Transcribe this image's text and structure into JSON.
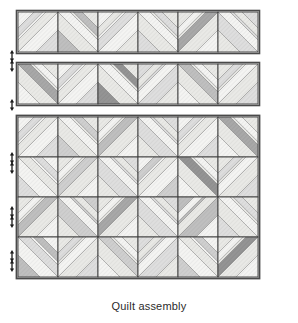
{
  "caption": "Quilt assembly",
  "figure": {
    "title": "Quilt assembly",
    "type": "quilt-assembly-diagram",
    "background": "#ffffff"
  },
  "colors": {
    "outline": "#4a4a4a",
    "block_outline": "#3d3d3d",
    "seam_line": "#6b6b6b",
    "arrow": "#1a1a1a",
    "caption_text": "#2b2b2b",
    "fabric_white": "#f4f4f2",
    "fabric_light": "#e9e9e6",
    "fabric_light2": "#dedede",
    "fabric_mid": "#cfcfcf",
    "fabric_mid2": "#bfbfbf",
    "fabric_dark": "#a8a8a8",
    "fabric_darker": "#949494"
  },
  "layout": {
    "strip_count": 2,
    "strip_block_count": 6,
    "quilt_columns": 6,
    "quilt_rows": 4,
    "block_size_px": 40,
    "quilt_left": 18,
    "quilt_top": 117,
    "strips": [
      {
        "label": "strip-row-1",
        "left": 18,
        "top": 12
      },
      {
        "label": "strip-row-2",
        "left": 18,
        "top": 64
      }
    ],
    "arrows": [
      {
        "name": "seam-arrow-1",
        "x": 12,
        "y": 56
      },
      {
        "name": "seam-arrow-2",
        "x": 12,
        "y": 66
      },
      {
        "name": "seam-arrow-3",
        "x": 12,
        "y": 105
      },
      {
        "name": "seam-arrow-4",
        "x": 12,
        "y": 158
      },
      {
        "name": "seam-arrow-5",
        "x": 12,
        "y": 168
      },
      {
        "name": "seam-arrow-6",
        "x": 12,
        "y": 212
      },
      {
        "name": "seam-arrow-7",
        "x": 12,
        "y": 222
      },
      {
        "name": "seam-arrow-8",
        "x": 12,
        "y": 256
      },
      {
        "name": "seam-arrow-9",
        "x": 12,
        "y": 266
      }
    ]
  },
  "chart_data": {
    "type": "table",
    "title": "Quilt assembly",
    "xlabel": "",
    "ylabel": "",
    "strip_rows": [
      {
        "name": "strip-row-1",
        "blocks": [
          {
            "variant": "ne",
            "tones": [
              "light",
              "white",
              "light2"
            ]
          },
          {
            "variant": "nw",
            "tones": [
              "white",
              "light",
              "mid2"
            ]
          },
          {
            "variant": "ne",
            "tones": [
              "light2",
              "white",
              "light"
            ]
          },
          {
            "variant": "nw",
            "tones": [
              "white",
              "light",
              "light2"
            ]
          },
          {
            "variant": "ne",
            "tones": [
              "dark",
              "light",
              "white"
            ]
          },
          {
            "variant": "nw",
            "tones": [
              "white",
              "light2",
              "light"
            ]
          }
        ]
      },
      {
        "name": "strip-row-2",
        "blocks": [
          {
            "variant": "nw",
            "tones": [
              "dark",
              "light",
              "white"
            ]
          },
          {
            "variant": "ne",
            "tones": [
              "light",
              "white",
              "light2"
            ]
          },
          {
            "variant": "nw",
            "tones": [
              "white",
              "light",
              "darker"
            ]
          },
          {
            "variant": "ne",
            "tones": [
              "white",
              "light2",
              "light"
            ]
          },
          {
            "variant": "nw",
            "tones": [
              "mid2",
              "light",
              "white"
            ]
          },
          {
            "variant": "ne",
            "tones": [
              "white",
              "light",
              "light2"
            ]
          }
        ]
      }
    ],
    "quilt_rows": [
      {
        "name": "quilt-row-1",
        "blocks": [
          {
            "variant": "ne",
            "tones": [
              "light",
              "white",
              "light2"
            ]
          },
          {
            "variant": "nw",
            "tones": [
              "white",
              "light",
              "mid"
            ]
          },
          {
            "variant": "ne",
            "tones": [
              "mid2",
              "light",
              "white"
            ]
          },
          {
            "variant": "nw",
            "tones": [
              "white",
              "light2",
              "light"
            ]
          },
          {
            "variant": "ne",
            "tones": [
              "light",
              "white",
              "light2"
            ]
          },
          {
            "variant": "nw",
            "tones": [
              "dark",
              "light",
              "white"
            ]
          }
        ]
      },
      {
        "name": "quilt-row-2",
        "blocks": [
          {
            "variant": "nw",
            "tones": [
              "light",
              "white",
              "light2"
            ]
          },
          {
            "variant": "ne",
            "tones": [
              "mid",
              "light",
              "white"
            ]
          },
          {
            "variant": "nw",
            "tones": [
              "white",
              "light2",
              "light"
            ]
          },
          {
            "variant": "ne",
            "tones": [
              "light",
              "white",
              "mid"
            ]
          },
          {
            "variant": "nw",
            "tones": [
              "darker",
              "light",
              "white"
            ]
          },
          {
            "variant": "ne",
            "tones": [
              "white",
              "light",
              "light2"
            ]
          }
        ]
      },
      {
        "name": "quilt-row-3",
        "blocks": [
          {
            "variant": "ne",
            "tones": [
              "mid2",
              "light",
              "white"
            ]
          },
          {
            "variant": "nw",
            "tones": [
              "white",
              "mid",
              "light"
            ]
          },
          {
            "variant": "ne",
            "tones": [
              "dark",
              "light",
              "white"
            ]
          },
          {
            "variant": "nw",
            "tones": [
              "white",
              "light2",
              "light"
            ]
          },
          {
            "variant": "ne",
            "tones": [
              "light",
              "mid2",
              "white"
            ]
          },
          {
            "variant": "nw",
            "tones": [
              "white",
              "light",
              "light2"
            ]
          }
        ]
      },
      {
        "name": "quilt-row-4",
        "blocks": [
          {
            "variant": "nw",
            "tones": [
              "light2",
              "white",
              "mid2"
            ]
          },
          {
            "variant": "ne",
            "tones": [
              "white",
              "light",
              "light2"
            ]
          },
          {
            "variant": "nw",
            "tones": [
              "mid",
              "light",
              "white"
            ]
          },
          {
            "variant": "ne",
            "tones": [
              "white",
              "light2",
              "light"
            ]
          },
          {
            "variant": "nw",
            "tones": [
              "light",
              "white",
              "mid"
            ]
          },
          {
            "variant": "ne",
            "tones": [
              "darker",
              "light",
              "white"
            ]
          }
        ]
      }
    ]
  }
}
